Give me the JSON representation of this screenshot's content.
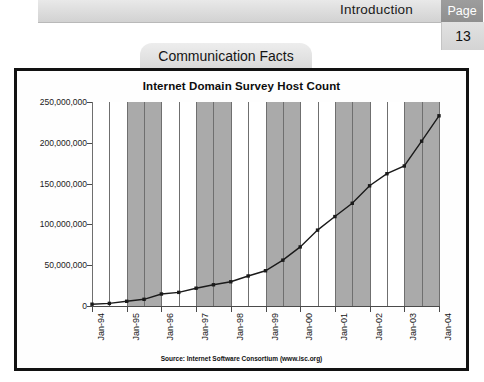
{
  "header": {
    "section_title": "Introduction",
    "page_label": "Page",
    "page_number": "13"
  },
  "section_tab": {
    "label": "Communication Facts"
  },
  "figure": {
    "source_note": "Source: Internet Software Consortium (www.isc.org)"
  },
  "chart_data": {
    "type": "line",
    "title": "Internet Domain Survey Host Count",
    "xlabel": "",
    "ylabel": "",
    "ylim": [
      0,
      250000000
    ],
    "yticks": [
      0,
      50000000,
      100000000,
      150000000,
      200000000,
      250000000
    ],
    "ytick_labels": [
      "0",
      "50,000,000",
      "100,000,000",
      "150,000,000",
      "200,000,000",
      "250,000,000"
    ],
    "xtick_labels": [
      "Jan-94",
      "Jan-95",
      "Jan-96",
      "Jan-97",
      "Jan-98",
      "Jan-99",
      "Jan-00",
      "Jan-01",
      "Jan-02",
      "Jan-03",
      "Jan-04"
    ],
    "grid": "vertical",
    "banding": "alternating-gray-year-bands",
    "legend": "none",
    "marker": "square",
    "line_color": "#1a1a1a",
    "band_color": "#aaaaaa",
    "x": [
      "Jan-94",
      "Jul-94",
      "Jan-95",
      "Jul-95",
      "Jan-96",
      "Jul-96",
      "Jan-97",
      "Jul-97",
      "Jan-98",
      "Jul-98",
      "Jan-99",
      "Jul-99",
      "Jan-00",
      "Jul-00",
      "Jan-01",
      "Jul-01",
      "Jan-02",
      "Jul-02",
      "Jan-03",
      "Jul-03",
      "Jan-04"
    ],
    "values": [
      2200000,
      3200000,
      5800000,
      8200000,
      14700000,
      16700000,
      21800000,
      26000000,
      29700000,
      36800000,
      43200000,
      56200000,
      72400000,
      93000000,
      109600000,
      125900000,
      147300000,
      162100000,
      171600000,
      202000000,
      233100000
    ]
  }
}
